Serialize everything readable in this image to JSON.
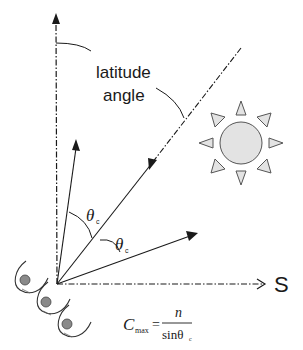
{
  "diagram": {
    "labels": {
      "latitude_line1": "latitude",
      "latitude_line2": "angle",
      "south": "S",
      "theta_upper": "θ",
      "theta_upper_sub": "c",
      "theta_lower": "θ",
      "theta_lower_sub": "c"
    },
    "formula": {
      "lhs": "C",
      "lhs_sub": "max",
      "equals": "=",
      "numerator": "n",
      "denominator": "sinθ",
      "denominator_sub": "c"
    },
    "icons": {
      "sun": "sun-icon",
      "collectors": [
        "concentrator-cup-icon",
        "concentrator-cup-icon",
        "concentrator-cup-icon"
      ]
    },
    "colors": {
      "line": "#1a1a1a",
      "sun_fill": "#e3e3e3",
      "sun_stroke": "#555555",
      "absorber_fill": "#8a8a8a"
    }
  }
}
